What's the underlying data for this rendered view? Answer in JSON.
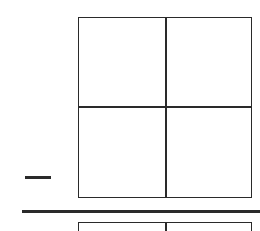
{
  "diagram": {
    "type": "grid-fragment",
    "stroke_color": "#2a2a2a",
    "background_color": "#ffffff",
    "main_grid": {
      "rows": 2,
      "cols": 2
    },
    "lower_grid": {
      "rows": 2,
      "cols": 2,
      "partially_visible": true
    },
    "labels": []
  }
}
